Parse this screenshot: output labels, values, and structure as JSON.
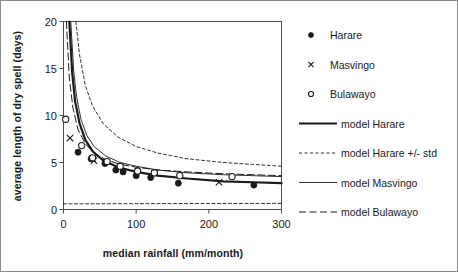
{
  "chart_data": {
    "type": "scatter",
    "title": "",
    "xlabel": "median rainfall (mm/month)",
    "ylabel": "average length of dry spell (days)",
    "xlim": [
      0,
      300
    ],
    "ylim": [
      0,
      20
    ],
    "xticks": [
      0,
      100,
      200,
      300
    ],
    "yticks": [
      0,
      5,
      10,
      15,
      20
    ],
    "xtick_labels": [
      "0",
      "100",
      "200",
      "300"
    ],
    "ytick_labels": [
      "0",
      "5",
      "10",
      "15",
      "20"
    ],
    "grid": false,
    "legend_position": "right-outside",
    "series": [
      {
        "name": "Harare",
        "kind": "scatter",
        "marker": "filled-circle",
        "points": [
          {
            "x": 20,
            "y": 6.1
          },
          {
            "x": 38,
            "y": 5.4
          },
          {
            "x": 57,
            "y": 4.9
          },
          {
            "x": 72,
            "y": 4.2
          },
          {
            "x": 82,
            "y": 4.0
          },
          {
            "x": 100,
            "y": 3.6
          },
          {
            "x": 120,
            "y": 3.4
          },
          {
            "x": 158,
            "y": 2.8
          },
          {
            "x": 262,
            "y": 2.6
          }
        ]
      },
      {
        "name": "Masvingo",
        "kind": "scatter",
        "marker": "cross",
        "points": [
          {
            "x": 9,
            "y": 7.6
          },
          {
            "x": 40,
            "y": 5.4
          },
          {
            "x": 42,
            "y": 5.2
          },
          {
            "x": 125,
            "y": 3.9
          },
          {
            "x": 214,
            "y": 2.9
          }
        ]
      },
      {
        "name": "Bulawayo",
        "kind": "scatter",
        "marker": "open-circle",
        "points": [
          {
            "x": 3,
            "y": 9.6
          },
          {
            "x": 25,
            "y": 6.8
          },
          {
            "x": 40,
            "y": 5.5
          },
          {
            "x": 60,
            "y": 5.1
          },
          {
            "x": 78,
            "y": 4.6
          },
          {
            "x": 102,
            "y": 4.1
          },
          {
            "x": 125,
            "y": 3.9
          },
          {
            "x": 160,
            "y": 3.6
          },
          {
            "x": 232,
            "y": 3.5
          }
        ]
      },
      {
        "name": "model Harare",
        "kind": "line",
        "style": "solid-thick",
        "formula_points": [
          {
            "x": 8,
            "y": 20.0
          },
          {
            "x": 12,
            "y": 14.5
          },
          {
            "x": 16,
            "y": 11.5
          },
          {
            "x": 22,
            "y": 9.2
          },
          {
            "x": 30,
            "y": 7.4
          },
          {
            "x": 40,
            "y": 6.2
          },
          {
            "x": 55,
            "y": 5.2
          },
          {
            "x": 75,
            "y": 4.5
          },
          {
            "x": 100,
            "y": 4.0
          },
          {
            "x": 130,
            "y": 3.6
          },
          {
            "x": 170,
            "y": 3.3
          },
          {
            "x": 220,
            "y": 3.0
          },
          {
            "x": 260,
            "y": 2.9
          },
          {
            "x": 300,
            "y": 2.8
          }
        ]
      },
      {
        "name": "model Harare +/- std",
        "kind": "line",
        "style": "dashed-fine",
        "upper_points": [
          {
            "x": 17,
            "y": 20.0
          },
          {
            "x": 22,
            "y": 16.5
          },
          {
            "x": 30,
            "y": 13.2
          },
          {
            "x": 40,
            "y": 11.0
          },
          {
            "x": 55,
            "y": 9.1
          },
          {
            "x": 75,
            "y": 7.7
          },
          {
            "x": 100,
            "y": 6.7
          },
          {
            "x": 130,
            "y": 6.0
          },
          {
            "x": 170,
            "y": 5.4
          },
          {
            "x": 220,
            "y": 5.0
          },
          {
            "x": 260,
            "y": 4.8
          },
          {
            "x": 300,
            "y": 4.6
          }
        ],
        "lower_points": [
          {
            "x": 0,
            "y": 0.6
          },
          {
            "x": 100,
            "y": 0.62
          },
          {
            "x": 200,
            "y": 0.64
          },
          {
            "x": 300,
            "y": 0.65
          }
        ]
      },
      {
        "name": "model Masvingo",
        "kind": "line",
        "style": "solid-thin",
        "formula_points": [
          {
            "x": 10,
            "y": 20.0
          },
          {
            "x": 14,
            "y": 14.8
          },
          {
            "x": 18,
            "y": 12.0
          },
          {
            "x": 24,
            "y": 9.6
          },
          {
            "x": 32,
            "y": 7.9
          },
          {
            "x": 42,
            "y": 6.7
          },
          {
            "x": 58,
            "y": 5.7
          },
          {
            "x": 78,
            "y": 5.0
          },
          {
            "x": 100,
            "y": 4.6
          },
          {
            "x": 130,
            "y": 4.2
          },
          {
            "x": 170,
            "y": 3.9
          },
          {
            "x": 220,
            "y": 3.7
          },
          {
            "x": 260,
            "y": 3.6
          },
          {
            "x": 300,
            "y": 3.5
          }
        ]
      },
      {
        "name": "model Bulawayo",
        "kind": "line",
        "style": "dashed-long",
        "formula_points": [
          {
            "x": 4,
            "y": 20.0
          },
          {
            "x": 8,
            "y": 14.0
          },
          {
            "x": 13,
            "y": 10.8
          },
          {
            "x": 20,
            "y": 8.5
          },
          {
            "x": 30,
            "y": 7.0
          },
          {
            "x": 42,
            "y": 6.0
          },
          {
            "x": 58,
            "y": 5.3
          },
          {
            "x": 78,
            "y": 4.8
          },
          {
            "x": 100,
            "y": 4.5
          },
          {
            "x": 130,
            "y": 4.2
          },
          {
            "x": 170,
            "y": 4.0
          },
          {
            "x": 220,
            "y": 3.8
          },
          {
            "x": 260,
            "y": 3.7
          },
          {
            "x": 300,
            "y": 3.6
          }
        ]
      }
    ]
  },
  "legend": {
    "entries": [
      {
        "label": "Harare",
        "symbol": "filled-circle"
      },
      {
        "label": "Masvingo",
        "symbol": "cross"
      },
      {
        "label": "Bulawayo",
        "symbol": "open-circle"
      },
      {
        "label": "model Harare",
        "symbol": "solid-thick"
      },
      {
        "label": "model Harare +/- std",
        "symbol": "dashed-fine"
      },
      {
        "label": "model Masvingo",
        "symbol": "solid-thin"
      },
      {
        "label": "model Bulawayo",
        "symbol": "dashed-long"
      }
    ]
  },
  "colors": {
    "ink": "#1a1a1a",
    "frame": "#4d4d4d",
    "page_border": "#8a8a8a",
    "background": "#ffffff"
  }
}
